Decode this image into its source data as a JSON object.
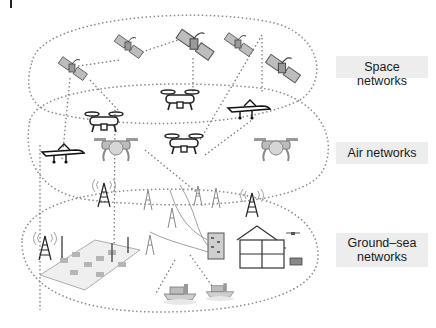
{
  "figure": {
    "type": "layered network architecture diagram",
    "layers": [
      {
        "id": "space",
        "label": "Space networks",
        "elements": [
          "satellite",
          "satellite",
          "satellite",
          "satellite",
          "satellite"
        ]
      },
      {
        "id": "air",
        "label": "Air networks",
        "elements": [
          "quadcopter-drone",
          "quadcopter-drone",
          "quadcopter-drone",
          "fixed-wing-uav",
          "fixed-wing-uav",
          "large-quadcopter-drone",
          "large-quadcopter-drone"
        ]
      },
      {
        "id": "ground",
        "label_line1": "Ground–sea",
        "label_line2": "networks",
        "elements": [
          "cell-tower",
          "cell-tower",
          "cell-tower",
          "smart-city",
          "iot-sensor-field",
          "data-center",
          "smart-home",
          "ship",
          "ship",
          "car"
        ]
      }
    ],
    "colors": {
      "ellipse_stroke": "#8a8a8a",
      "link_stroke": "#7a7a7a",
      "label_bg": "#ededed",
      "icon_dark": "#2a2a2a",
      "icon_mid": "#888888",
      "icon_light": "#c8c8c8"
    }
  },
  "labels": {
    "space": "Space networks",
    "air": "Air networks",
    "ground_line1": "Ground–sea",
    "ground_line2": "networks"
  }
}
